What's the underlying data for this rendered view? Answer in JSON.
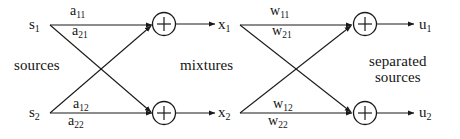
{
  "diagram": {
    "stroke_color": "#1a1a1a",
    "text_color": "#141414",
    "background": "#ffffff",
    "group_labels": {
      "sources": "sources",
      "mixtures": "mixtures",
      "separated_line1": "separated",
      "separated_line2": "sources"
    },
    "nodes": {
      "source_1": "s",
      "source_1_sub": "1",
      "source_2": "s",
      "source_2_sub": "2",
      "mixture_1": "x",
      "mixture_1_sub": "1",
      "mixture_2": "x",
      "mixture_2_sub": "2",
      "output_1": "u",
      "output_1_sub": "1",
      "output_2": "u",
      "output_2_sub": "2",
      "adder_symbol": "+"
    },
    "mixing_weights": {
      "a11": "a",
      "a11_sub": "11",
      "a21": "a",
      "a21_sub": "21",
      "a12": "a",
      "a12_sub": "12",
      "a22": "a",
      "a22_sub": "22"
    },
    "unmixing_weights": {
      "w11": "w",
      "w11_sub": "11",
      "w21": "w",
      "w21_sub": "21",
      "w12": "w",
      "w12_sub": "12",
      "w22": "w",
      "w22_sub": "22"
    }
  }
}
